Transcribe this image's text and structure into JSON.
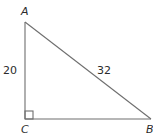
{
  "diagram": {
    "type": "right-triangle",
    "vertices": {
      "A": {
        "label": "A"
      },
      "B": {
        "label": "B"
      },
      "C": {
        "label": "C"
      }
    },
    "right_angle_at": "C",
    "sides": {
      "AC": {
        "label": "20"
      },
      "AB": {
        "label": "32"
      },
      "CB": {
        "label": ""
      }
    },
    "colors": {
      "line": "#6e6e6e",
      "text": "#2b2b2b"
    }
  }
}
